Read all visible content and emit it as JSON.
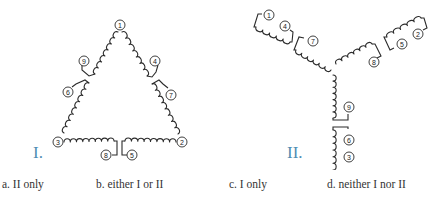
{
  "figure": {
    "diagram_I": {
      "label": "I.",
      "type": "delta",
      "vertices": [
        {
          "id": "1",
          "x": 120,
          "y": 25
        },
        {
          "id": "2",
          "x": 182,
          "y": 142
        },
        {
          "id": "3",
          "x": 58,
          "y": 142
        }
      ],
      "terminals": [
        "1",
        "2",
        "3",
        "4",
        "5",
        "6",
        "7",
        "8",
        "9"
      ]
    },
    "diagram_II": {
      "label": "II.",
      "type": "wye",
      "terminals": [
        "1",
        "4",
        "7",
        "2",
        "5",
        "8",
        "9",
        "6",
        "3"
      ]
    },
    "colors": {
      "label_accent": "#4f8db3",
      "line": "#2b2b2b",
      "text": "#333333"
    }
  },
  "answers": [
    {
      "letter": "a.",
      "text": "II only"
    },
    {
      "letter": "b.",
      "text": "either I or II"
    },
    {
      "letter": "c.",
      "text": "I only"
    },
    {
      "letter": "d.",
      "text": "neither I nor II"
    }
  ]
}
